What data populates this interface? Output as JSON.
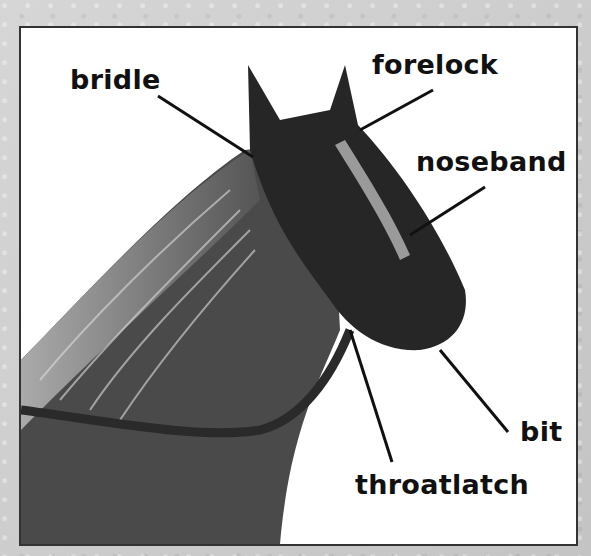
{
  "diagram": {
    "colors": {
      "frame_border": "#333333",
      "paper": "#ffffff",
      "background": "#cccccc",
      "ink": "#111111"
    },
    "labels": [
      {
        "id": "bridle",
        "text": "bridle",
        "x": 70,
        "y": 66
      },
      {
        "id": "forelock",
        "text": "forelock",
        "x": 372,
        "y": 51
      },
      {
        "id": "noseband",
        "text": "noseband",
        "x": 416,
        "y": 148
      },
      {
        "id": "bit",
        "text": "bit",
        "x": 520,
        "y": 418
      },
      {
        "id": "throatlatch",
        "text": "throatlatch",
        "x": 355,
        "y": 471
      }
    ]
  }
}
